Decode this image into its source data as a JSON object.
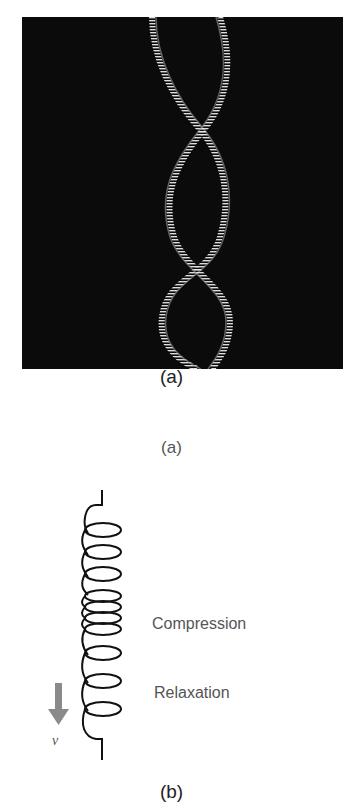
{
  "figure_a": {
    "image_description": "Photograph of a double-helix spring pattern on black background",
    "caption_primary": "(a)",
    "caption_secondary": "(a)"
  },
  "figure_b": {
    "labels": {
      "compression": "Compression",
      "relaxation": "Relaxation",
      "velocity": "v"
    },
    "caption": "(b)",
    "colors": {
      "arrow": "#8a8a8a",
      "spring": "#111111",
      "text": "#555555"
    }
  }
}
